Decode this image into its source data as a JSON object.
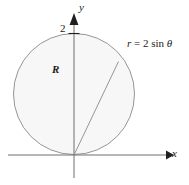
{
  "figure": {
    "axes": {
      "x_label": "x",
      "y_label": "y",
      "y_tick_label": "2",
      "x_axis_y": 155,
      "y_axis_x": 74,
      "origin": {
        "x": 74,
        "y": 155
      }
    },
    "region": {
      "label": "R"
    },
    "curve": {
      "equation_r": "r",
      "equation_eq": "=",
      "equation_rhs": "2 sin",
      "equation_theta": "θ",
      "equation_full": "r = 2 sin θ",
      "center": {
        "x": 74,
        "y": 94
      },
      "radius": 60.5,
      "top_y": 33.5
    },
    "ray": {
      "from": {
        "x": 74,
        "y": 155
      },
      "to": {
        "x": 118.5,
        "y": 61.5
      }
    },
    "colors": {
      "fill": "#f7f7f7",
      "curve_stroke": "#8a8a8a",
      "axis_stroke": "#6e6e6e",
      "ray_stroke": "#8a8a8a",
      "text": "#1a1a1a",
      "background": "#ffffff"
    }
  }
}
